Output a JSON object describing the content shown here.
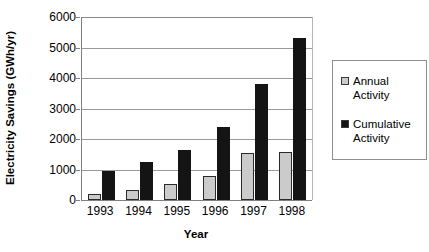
{
  "chart_data": {
    "type": "bar",
    "title": "",
    "xlabel": "Year",
    "ylabel": "Electricity Savings (GWh/yr)",
    "categories": [
      "1993",
      "1994",
      "1995",
      "1996",
      "1997",
      "1998"
    ],
    "series": [
      {
        "name": "Annual Activity",
        "color": "#cbcbcb",
        "values": [
          200,
          330,
          520,
          800,
          1550,
          1580
        ]
      },
      {
        "name": "Cumulative Activity",
        "color": "#141414",
        "values": [
          950,
          1240,
          1650,
          2380,
          3820,
          5300
        ]
      }
    ],
    "ylim": [
      0,
      6000
    ],
    "y_ticks": [
      0,
      1000,
      2000,
      3000,
      4000,
      5000,
      6000
    ],
    "y_tick_labels": [
      "0",
      "1000",
      "2000",
      "3000",
      "4000",
      "5000",
      "6000"
    ],
    "grid": true,
    "legend_position": "right"
  },
  "legend": {
    "entries": [
      {
        "label_line1": "Annual",
        "label_line2": "Activity",
        "color": "#cbcbcb"
      },
      {
        "label_line1": "Cumulative",
        "label_line2": "Activity",
        "color": "#141414"
      }
    ]
  }
}
